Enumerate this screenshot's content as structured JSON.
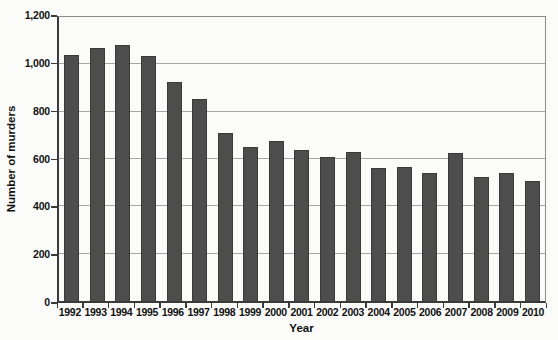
{
  "chart_data": {
    "type": "bar",
    "title": "",
    "xlabel": "Year",
    "ylabel": "Number of murders",
    "categories": [
      "1992",
      "1993",
      "1994",
      "1995",
      "1996",
      "1997",
      "1998",
      "1999",
      "2000",
      "2001",
      "2002",
      "2003",
      "2004",
      "2005",
      "2006",
      "2007",
      "2008",
      "2009",
      "2010"
    ],
    "values": [
      1040,
      1070,
      1080,
      1035,
      925,
      855,
      710,
      650,
      675,
      640,
      607,
      630,
      560,
      565,
      540,
      625,
      524,
      542,
      505
    ],
    "ylim": [
      0,
      1200
    ],
    "y_tick_interval": 200,
    "y_tick_labels": [
      "0",
      "200",
      "400",
      "600",
      "800",
      "1,000",
      "1,200"
    ],
    "grid": "horizontal",
    "legend": "none",
    "colors": {
      "bar_fill": "#4d4d4d",
      "bar_border": "#3a3a3a",
      "gridline": "#a6a6a6",
      "axis": "#3a3a3a",
      "frame": "#8c8c8c",
      "text": "#111111",
      "background": "#fbfbfa"
    }
  }
}
